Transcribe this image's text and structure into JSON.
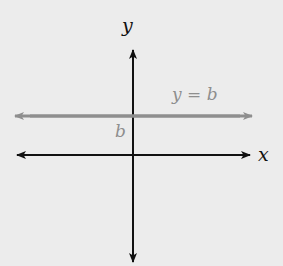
{
  "diagram": {
    "type": "coordinate-plane",
    "background": "#ececec",
    "axes": {
      "x_label": "x",
      "y_label": "y",
      "color": "#111111"
    },
    "horizontal_line": {
      "equation_label": "y = b",
      "intercept_label": "b",
      "color": "#8e8e8e"
    }
  }
}
